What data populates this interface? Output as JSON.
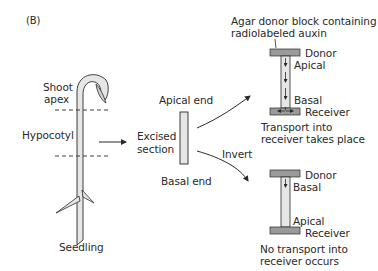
{
  "panel_label": "(B)",
  "seedling": {
    "shoot_apex_label_1": "Shoot",
    "shoot_apex_label_2": "apex",
    "hypocotyl_label": "Hypocotyl",
    "seedling_label": "Seedling"
  },
  "excised": {
    "label_1": "Excised",
    "label_2": "section",
    "apical_end": "Apical end",
    "basal_end": "Basal end",
    "invert_label": "Invert"
  },
  "top_setup": {
    "agar_label_1": "Agar donor block containing",
    "agar_label_2": "radiolabeled auxin",
    "donor": "Donor",
    "apical": "Apical",
    "basal": "Basal",
    "receiver": "Receiver",
    "result_1": "Transport into",
    "result_2": "receiver takes place"
  },
  "bottom_setup": {
    "donor": "Donor",
    "basal": "Basal",
    "apical": "Apical",
    "receiver": "Receiver",
    "result_1": "No transport into",
    "result_2": "receiver occurs"
  },
  "colors": {
    "block_fill": "#9a9a9a",
    "stem_fill": "#e6e6e6",
    "line": "#2a2a2a"
  }
}
